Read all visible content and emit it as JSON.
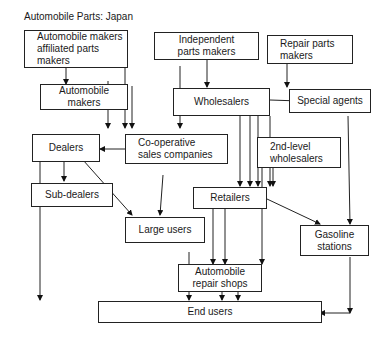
{
  "title": "Automobile Parts: Japan",
  "nodes": {
    "affiliated": "Automobile makers\naffiliated parts\nmakers",
    "independent": "Independent\nparts makers",
    "repair_makers": "Repair parts\nmakers",
    "auto_makers": "Automobile\nmakers",
    "wholesalers": "Wholesalers",
    "special_agents": "Special agents",
    "dealers": "Dealers",
    "coop": "Co-operative\nsales companies",
    "second_wholesalers": "2nd-level\nwholesalers",
    "sub_dealers": "Sub-dealers",
    "retailers": "Retailers",
    "large_users": "Large users",
    "gasoline": "Gasoline\nstations",
    "repair_shops": "Automobile\nrepair shops",
    "end_users": "End users"
  }
}
